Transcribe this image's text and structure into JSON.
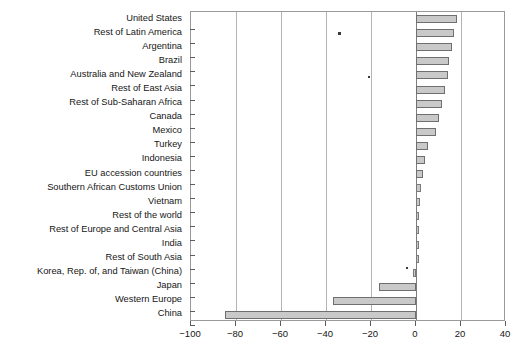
{
  "chart_data": {
    "type": "bar",
    "orientation": "horizontal",
    "title": "",
    "xlabel": "",
    "ylabel": "",
    "xlim": [
      -100,
      40
    ],
    "xticks": [
      -100,
      -80,
      -60,
      -40,
      -20,
      0,
      20,
      40
    ],
    "xtick_labels": [
      "−100",
      "−80",
      "−60",
      "−40",
      "−20",
      "0",
      "20",
      "40"
    ],
    "grid": true,
    "grid_axis": "x",
    "legend": "none",
    "bar_fill_color": "#c9c9c9",
    "bar_edge_color": "#6f6f6f",
    "zero_line_color": "#7d7d7d",
    "categories": [
      "United States",
      "Rest of Latin America",
      "Argentina",
      "Brazil",
      "Australia and New Zealand",
      "Rest of East Asia",
      "Rest of Sub-Saharan Africa",
      "Canada",
      "Mexico",
      "Turkey",
      "Indonesia",
      "EU accession countries",
      "Southern African Customs Union",
      "Vietnam",
      "Rest of the world",
      "Rest of Europe and Central Asia",
      "India",
      "Rest of South Asia",
      "Korea, Rep. of, and Taiwan (China)",
      "Japan",
      "Western Europe",
      "China"
    ],
    "values": [
      18.2,
      17.0,
      16.0,
      14.7,
      14.0,
      13.0,
      11.5,
      10.0,
      9.0,
      5.5,
      4.0,
      3.0,
      2.2,
      1.8,
      1.5,
      1.2,
      1.0,
      0.8,
      -1.5,
      -16.4,
      -37.0,
      -85.0
    ]
  }
}
